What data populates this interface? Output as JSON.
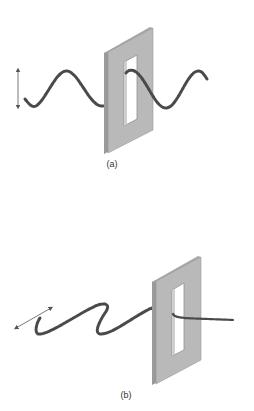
{
  "panels": [
    {
      "id": "a",
      "label": "(a)",
      "description": "Vertically polarized wave passing through a vertical slit",
      "arrow_orientation": "vertical",
      "passes": true
    },
    {
      "id": "b",
      "label": "(b)",
      "description": "Horizontally polarized wave blocked by a vertical slit",
      "arrow_orientation": "horizontal",
      "passes": false
    }
  ],
  "colors": {
    "wave": "#4a4a4a",
    "board_face": "#b9b9b9",
    "board_edge": "#9a9a9a",
    "slot": "#ffffff",
    "arrow": "#555555"
  }
}
